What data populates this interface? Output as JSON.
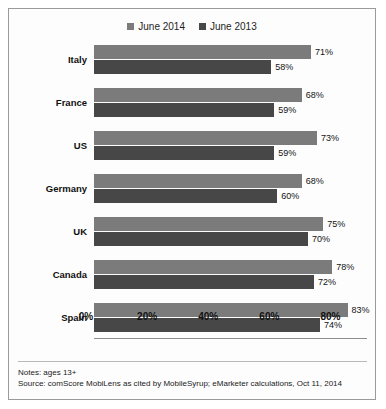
{
  "chart_data": {
    "type": "bar",
    "orientation": "horizontal",
    "title": "",
    "xlabel": "",
    "ylabel": "",
    "categories": [
      "Italy",
      "France",
      "US",
      "Germany",
      "UK",
      "Canada",
      "Spain"
    ],
    "series": [
      {
        "name": "June 2014",
        "color": "#7b7b7b",
        "values": [
          71,
          68,
          73,
          68,
          75,
          78,
          83
        ]
      },
      {
        "name": "June 2013",
        "color": "#474747",
        "values": [
          58,
          59,
          59,
          60,
          70,
          72,
          74
        ]
      }
    ],
    "value_labels": [
      [
        "71%",
        "58%"
      ],
      [
        "68%",
        "59%"
      ],
      [
        "73%",
        "59%"
      ],
      [
        "68%",
        "60%"
      ],
      [
        "75%",
        "70%"
      ],
      [
        "78%",
        "72%"
      ],
      [
        "83%",
        "74%"
      ]
    ],
    "xlim": [
      0,
      90
    ],
    "xticks": [
      0,
      20,
      40,
      60,
      80
    ],
    "xtick_labels": [
      "0%",
      "20%",
      "40%",
      "60%",
      "80%"
    ],
    "grid": false,
    "legend_position": "top-center"
  },
  "legend": {
    "entries": [
      {
        "label": "June 2014",
        "color": "#7b7b7b"
      },
      {
        "label": "June 2013",
        "color": "#474747"
      }
    ]
  },
  "footer": {
    "notes": "Notes: ages 13+",
    "source": "Source: comScore MobiLens as cited by MobileSyrup; eMarketer calculations, Oct 11, 2014"
  }
}
